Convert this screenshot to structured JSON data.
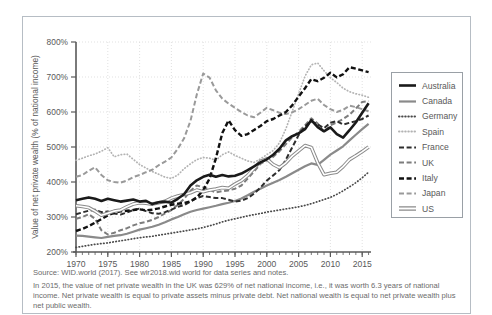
{
  "figure": {
    "source": "Source: WID.world (2017). See wir2018.wid world for data series and notes.",
    "note": "In 2015, the value of net private wealth in the UK was 629% of net national income, i.e., it was worth 6.3 years of national income. Net private wealth is equal to private assets minus private debt. Net national wealth is equal to net private wealth plus net public wealth."
  },
  "chart_data": {
    "type": "line",
    "title": "",
    "xlabel": "",
    "ylabel": "Value of net private wealth (% of national income)",
    "x_start": 1970,
    "x_step": 1,
    "x_end": 2016,
    "xlim": [
      1970,
      2016.5
    ],
    "ylim": [
      200,
      800
    ],
    "y_tick_values": [
      200,
      300,
      400,
      500,
      600,
      700,
      800
    ],
    "y_tick_suffix": "%",
    "x_tick_values": [
      1970,
      1975,
      1980,
      1985,
      1990,
      1995,
      2000,
      2005,
      2010,
      2015
    ],
    "grid": true,
    "legend_position": "right",
    "draw_order": [
      "Spain",
      "Japan",
      "Germany",
      "Canada",
      "UK",
      "France",
      "Italy",
      "US",
      "Australia"
    ],
    "colors": {
      "axis": "#595959",
      "grid": "#d9d9d9",
      "tick_text": "#595959",
      "legend_border": "#9aa0a6",
      "frame_border": "#b6bdc4"
    },
    "series": [
      {
        "name": "Australia",
        "color": "#1a1a1a",
        "width": 2.6,
        "style": "solid",
        "values": [
          348,
          352,
          356,
          352,
          346,
          352,
          348,
          344,
          347,
          350,
          344,
          346,
          337,
          342,
          344,
          341,
          352,
          365,
          390,
          405,
          415,
          421,
          415,
          420,
          416,
          418,
          424,
          434,
          445,
          456,
          465,
          478,
          495,
          519,
          531,
          539,
          551,
          577,
          557,
          545,
          556,
          537,
          527,
          548,
          570,
          598,
          625
        ]
      },
      {
        "name": "Canada",
        "color": "#8a8a8a",
        "width": 2.2,
        "style": "solid",
        "values": [
          247,
          246,
          244,
          242,
          240,
          243,
          246,
          248,
          252,
          258,
          264,
          268,
          272,
          278,
          285,
          293,
          300,
          308,
          315,
          320,
          324,
          328,
          332,
          337,
          341,
          346,
          353,
          362,
          372,
          381,
          390,
          398,
          406,
          415,
          425,
          435,
          445,
          453,
          449,
          463,
          478,
          490,
          502,
          519,
          535,
          551,
          566
        ]
      },
      {
        "name": "Germany",
        "color": "#4a4a4a",
        "width": 1.7,
        "style": "dot",
        "values": [
          213,
          216,
          219,
          222,
          224,
          226,
          229,
          232,
          235,
          238,
          241,
          243,
          245,
          248,
          251,
          254,
          257,
          260,
          263,
          266,
          270,
          275,
          280,
          286,
          291,
          295,
          299,
          303,
          307,
          310,
          314,
          317,
          320,
          323,
          326,
          329,
          333,
          338,
          344,
          350,
          356,
          365,
          375,
          386,
          398,
          412,
          428
        ]
      },
      {
        "name": "Spain",
        "color": "#b3b3b3",
        "width": 1.7,
        "style": "dot",
        "values": [
          462,
          468,
          475,
          480,
          488,
          498,
          472,
          478,
          480,
          465,
          450,
          440,
          430,
          422,
          414,
          410,
          420,
          438,
          452,
          464,
          470,
          468,
          462,
          478,
          486,
          476,
          468,
          460,
          456,
          466,
          478,
          490,
          512,
          552,
          602,
          652,
          702,
          735,
          740,
          718,
          698,
          684,
          668,
          658,
          652,
          648,
          642
        ]
      },
      {
        "name": "France",
        "color": "#2e2e2e",
        "width": 2.0,
        "style": "dash",
        "values": [
          308,
          313,
          318,
          321,
          314,
          316,
          310,
          307,
          313,
          320,
          324,
          317,
          311,
          309,
          314,
          321,
          329,
          334,
          344,
          354,
          360,
          357,
          354,
          354,
          349,
          344,
          347,
          354,
          367,
          384,
          404,
          419,
          434,
          464,
          499,
          534,
          559,
          574,
          564,
          554,
          569,
          574,
          564,
          569,
          574,
          580,
          590
        ]
      },
      {
        "name": "UK",
        "color": "#7d7d7d",
        "width": 2.0,
        "style": "dash",
        "values": [
          295,
          300,
          308,
          295,
          262,
          250,
          255,
          262,
          268,
          276,
          282,
          286,
          292,
          300,
          310,
          320,
          335,
          352,
          375,
          390,
          385,
          378,
          370,
          374,
          376,
          381,
          390,
          410,
          430,
          452,
          462,
          472,
          488,
          508,
          528,
          543,
          562,
          582,
          567,
          543,
          562,
          570,
          580,
          592,
          610,
          629,
          631
        ]
      },
      {
        "name": "Italy",
        "color": "#111111",
        "width": 2.4,
        "style": "dash",
        "values": [
          260,
          266,
          274,
          284,
          294,
          305,
          312,
          316,
          318,
          320,
          322,
          319,
          321,
          325,
          330,
          335,
          338,
          340,
          345,
          356,
          376,
          410,
          468,
          540,
          576,
          548,
          532,
          537,
          549,
          560,
          574,
          580,
          590,
          600,
          619,
          644,
          668,
          694,
          688,
          698,
          712,
          699,
          708,
          728,
          724,
          719,
          714
        ]
      },
      {
        "name": "Japan",
        "color": "#9a9a9a",
        "width": 2.0,
        "style": "dash",
        "values": [
          415,
          420,
          432,
          442,
          420,
          405,
          400,
          398,
          404,
          414,
          420,
          428,
          435,
          448,
          458,
          470,
          495,
          525,
          575,
          650,
          710,
          698,
          662,
          638,
          624,
          612,
          600,
          590,
          585,
          598,
          612,
          605,
          598,
          594,
          599,
          608,
          620,
          632,
          638,
          620,
          608,
          600,
          606,
          618,
          614,
          608,
          602
        ]
      },
      {
        "name": "US",
        "color": "#8a8a8a",
        "width": 3.6,
        "style": "double",
        "values": [
          332,
          330,
          327,
          317,
          305,
          311,
          317,
          320,
          329,
          337,
          341,
          339,
          337,
          341,
          345,
          354,
          360,
          364,
          369,
          377,
          372,
          377,
          380,
          384,
          382,
          394,
          404,
          419,
          439,
          459,
          466,
          450,
          441,
          455,
          474,
          489,
          504,
          499,
          455,
          421,
          425,
          428,
          444,
          464,
          475,
          487,
          500
        ]
      }
    ]
  }
}
